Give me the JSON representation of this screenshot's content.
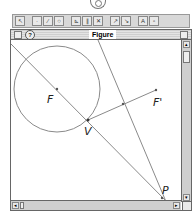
{
  "toolbar": {
    "buttons": [
      {
        "name": "pointer-tool",
        "glyph": "↖"
      },
      {
        "name": "point-tool",
        "glyph": "·"
      },
      {
        "name": "segment-tool",
        "glyph": "⁄"
      },
      {
        "name": "circle-tool",
        "glyph": "○"
      },
      {
        "name": "construct-tool-1",
        "glyph": "⊾"
      },
      {
        "name": "construct-tool-2",
        "glyph": "∥"
      },
      {
        "name": "construct-tool-3",
        "glyph": "✕"
      },
      {
        "name": "transform-tool-1",
        "glyph": "↗"
      },
      {
        "name": "transform-tool-2",
        "glyph": "↘"
      },
      {
        "name": "measure-tool-1",
        "glyph": "A"
      },
      {
        "name": "measure-tool-2",
        "glyph": "▫"
      }
    ]
  },
  "window": {
    "title": "Figure",
    "help_glyph": "?",
    "scroll_up": "▴",
    "scroll_down": "▾",
    "scroll_left": "◂",
    "scroll_right": "▸"
  },
  "figure": {
    "line_color": "#8a8a8a",
    "circle": {
      "cx": 46,
      "cy": 49,
      "r": 43
    },
    "points": {
      "F": {
        "x": 46,
        "y": 49,
        "label": "F"
      },
      "F_prime": {
        "x": 145,
        "y": 50,
        "label": "F'"
      },
      "V": {
        "x": 77,
        "y": 80,
        "label": "V"
      },
      "P": {
        "x": 151,
        "y": 158,
        "label": "P"
      },
      "M": {
        "x": 112,
        "y": 64
      }
    },
    "labels": {
      "F": "F",
      "F_prime": "F'",
      "V": "V",
      "P": "P"
    }
  }
}
